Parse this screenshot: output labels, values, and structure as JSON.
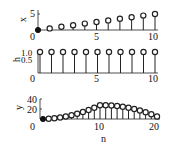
{
  "chart_data": [
    {
      "type": "stem",
      "title": "",
      "xlabel": "",
      "ylabel": "x",
      "x": [
        0,
        1,
        2,
        3,
        4,
        5,
        6,
        7,
        8,
        9,
        10
      ],
      "values": [
        0,
        0.5,
        1,
        1.5,
        2,
        2.5,
        3,
        3.5,
        4,
        4.5,
        5
      ],
      "xticks": [
        "0",
        "5",
        "10"
      ],
      "yticks": [
        "5"
      ],
      "xlim": [
        0,
        10
      ],
      "ylim": [
        0,
        5
      ],
      "grid": false
    },
    {
      "type": "stem",
      "title": "",
      "xlabel": "",
      "ylabel": "h",
      "x": [
        0,
        1,
        2,
        3,
        4,
        5,
        6,
        7,
        8,
        9,
        10
      ],
      "values": [
        1,
        1,
        1,
        1,
        1,
        1,
        1,
        1,
        1,
        1,
        1
      ],
      "xticks": [
        "0",
        "5",
        "10"
      ],
      "yticks": [
        "0.5",
        "1.0"
      ],
      "xlim": [
        0,
        10
      ],
      "ylim": [
        0,
        1
      ],
      "grid": false
    },
    {
      "type": "stem",
      "title": "",
      "xlabel": "n",
      "ylabel": "y",
      "x": [
        0,
        1,
        2,
        3,
        4,
        5,
        6,
        7,
        8,
        9,
        10,
        11,
        12,
        13,
        14,
        15,
        16,
        17,
        18,
        19,
        20
      ],
      "values": [
        0,
        0.5,
        1.5,
        3,
        5,
        7.5,
        10.5,
        14,
        18,
        22.5,
        27.5,
        27.5,
        27,
        26,
        24.5,
        22.5,
        20,
        17,
        13.5,
        9.5,
        5
      ],
      "xticks": [
        "0",
        "10",
        "20"
      ],
      "yticks": [
        "20",
        "40"
      ],
      "xlim": [
        0,
        20
      ],
      "ylim": [
        0,
        40
      ],
      "grid": false
    }
  ],
  "labels": {
    "p1": {
      "ylabel": "x",
      "yt": [
        "5"
      ],
      "xt": [
        "0",
        "5",
        "10"
      ]
    },
    "p2": {
      "ylabel": "h",
      "yt": [
        "1.0",
        "0.5"
      ],
      "xt": [
        "0",
        "5",
        "10"
      ]
    },
    "p3": {
      "ylabel": "y",
      "yt": [
        "40",
        "20"
      ],
      "xt": [
        "0",
        "10",
        "20"
      ],
      "xlabel": "n"
    }
  }
}
